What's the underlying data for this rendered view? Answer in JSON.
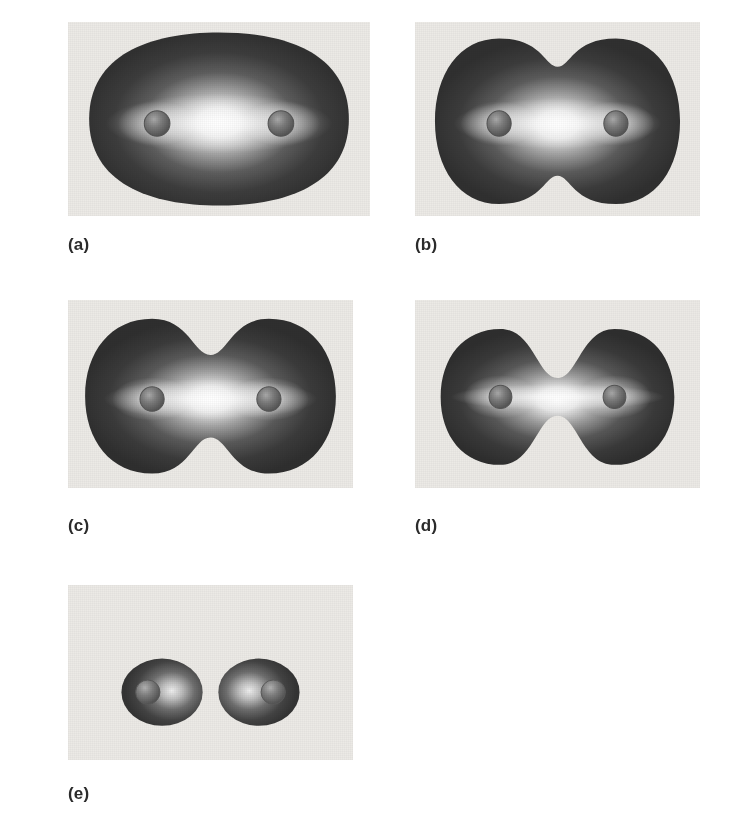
{
  "figure": {
    "panel_background": "#eceae6",
    "page_background": "#ffffff",
    "surface_dark": "#3a3a3a",
    "surface_light": "#f2f2f2",
    "nucleus_color": "#6d6d6d",
    "caption_color": "#2b2b2b"
  },
  "panels": [
    {
      "id": "a",
      "caption": "(a)",
      "description": "large rounded-rectangular isosurface fully enclosing both nuclei",
      "constriction": 0.0,
      "rect": {
        "x": 68,
        "y": 22,
        "w": 302,
        "h": 194
      },
      "caption_pos": {
        "x": 68,
        "y": 236
      },
      "nuclei": [
        {
          "cx": 0.295,
          "cy": 0.525,
          "r": 0.042
        },
        {
          "cx": 0.705,
          "cy": 0.525,
          "r": 0.042
        }
      ]
    },
    {
      "id": "b",
      "caption": "(b)",
      "description": "stadium isosurface with slight waist between the nuclei",
      "constriction": 0.16,
      "rect": {
        "x": 415,
        "y": 22,
        "w": 285,
        "h": 194
      },
      "caption_pos": {
        "x": 415,
        "y": 236
      },
      "nuclei": [
        {
          "cx": 0.295,
          "cy": 0.525,
          "r": 0.042
        },
        {
          "cx": 0.705,
          "cy": 0.525,
          "r": 0.042
        }
      ]
    },
    {
      "id": "c",
      "caption": "(c)",
      "description": "peanut-shaped isosurface with pronounced waist",
      "constriction": 0.38,
      "rect": {
        "x": 68,
        "y": 300,
        "w": 285,
        "h": 188
      },
      "caption_pos": {
        "x": 68,
        "y": 517
      },
      "nuclei": [
        {
          "cx": 0.295,
          "cy": 0.53,
          "r": 0.042
        },
        {
          "cx": 0.705,
          "cy": 0.53,
          "r": 0.042
        }
      ]
    },
    {
      "id": "d",
      "caption": "(d)",
      "description": "dumbbell isosurface pinched to a narrow neck",
      "constriction": 0.68,
      "rect": {
        "x": 415,
        "y": 300,
        "w": 285,
        "h": 188
      },
      "caption_pos": {
        "x": 415,
        "y": 517
      },
      "nuclei": [
        {
          "cx": 0.3,
          "cy": 0.53,
          "r": 0.04
        },
        {
          "cx": 0.7,
          "cy": 0.53,
          "r": 0.04
        }
      ]
    },
    {
      "id": "e",
      "caption": "(e)",
      "description": "two separate atomic spheroids, bond broken",
      "constriction": 1.0,
      "rect": {
        "x": 68,
        "y": 585,
        "w": 285,
        "h": 175
      },
      "caption_pos": {
        "x": 68,
        "y": 785
      },
      "nuclei": [
        {
          "cx": 0.33,
          "cy": 0.61,
          "r": 0.05
        },
        {
          "cx": 0.67,
          "cy": 0.61,
          "r": 0.05
        }
      ]
    }
  ],
  "chart_data": {
    "type": "contour",
    "series_label": "isovalue level",
    "categories": [
      "(a)",
      "(b)",
      "(c)",
      "(d)",
      "(e)"
    ],
    "values": [
      0.0,
      0.16,
      0.38,
      0.68,
      1.0
    ],
    "xlabel": "internuclear axis",
    "ylabel": "",
    "legend": [],
    "grid": false
  }
}
